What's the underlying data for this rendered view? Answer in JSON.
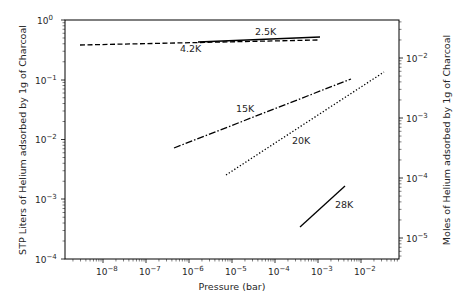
{
  "chart_data": {
    "type": "line",
    "title": "",
    "xlabel": "Pressure (bar)",
    "ylabel": "STP Liters of Helium adsorbed by 1g of Charcoal",
    "ylabel_right": "Moles of Helium adsorbed by 1g of Charcoal",
    "xscale": "log",
    "yscale": "log",
    "xlim": [
      1.3e-09,
      0.075
    ],
    "ylim": [
      0.0001,
      1
    ],
    "ylim_right": [
      4.46e-06,
      0.0446
    ],
    "xticks": [
      "10⁻⁸",
      "10⁻⁷",
      "10⁻⁶",
      "10⁻⁵",
      "10⁻⁴",
      "10⁻³",
      "10⁻²"
    ],
    "xtick_values": [
      1e-08,
      1e-07,
      1e-06,
      1e-05,
      0.0001,
      0.001,
      0.01
    ],
    "yticks": [
      "10⁰",
      "10⁻¹",
      "10⁻²",
      "10⁻³",
      "10⁻⁴"
    ],
    "ytick_values": [
      1,
      0.1,
      0.01,
      0.001,
      0.0001
    ],
    "yticks_right": [
      "10⁻²",
      "10⁻³",
      "10⁻⁴",
      "10⁻⁵"
    ],
    "ytick_right_values": [
      0.01,
      0.001,
      0.0001,
      1e-05
    ],
    "grid": false,
    "legend": "none (inline labels)",
    "series": [
      {
        "name": "2.5K",
        "style": "solid",
        "x": [
          1.6e-06,
          0.0011
        ],
        "y": [
          0.43,
          0.52
        ],
        "label_pos": [
          5e-05,
          0.62
        ]
      },
      {
        "name": "4.2K",
        "style": "dashed",
        "x": [
          3e-09,
          0.001
        ],
        "y": [
          0.38,
          0.47
        ],
        "label_pos": [
          2e-06,
          0.31
        ]
      },
      {
        "name": "15K",
        "style": "dashdot",
        "x": [
          4.9e-07,
          0.0063
        ],
        "y": [
          0.0072,
          0.102
        ],
        "label_pos": [
          2e-06,
          0.022
        ]
      },
      {
        "name": "20K",
        "style": "dotted",
        "x": [
          7.9e-06,
          0.036
        ],
        "y": [
          0.0025,
          0.135
        ],
        "label_pos": [
          8e-05,
          0.0078
        ]
      },
      {
        "name": "28K",
        "style": "solid",
        "x": [
          0.0004,
          0.012
        ],
        "y": [
          0.00034,
          0.0046
        ],
        "label_pos": [
          0.006,
          0.00045
        ]
      }
    ]
  },
  "labels": {
    "xlabel": "Pressure (bar)",
    "ylabel": "STP Liters of Helium adsorbed by 1g of Charcoal",
    "ylabel_right": "Moles of Helium adsorbed by 1g of Charcoal",
    "series": [
      "2.5K",
      "4.2K",
      "15K",
      "20K",
      "28K"
    ],
    "xticks": [
      "−8",
      "−7",
      "−6",
      "−5",
      "−4",
      "−3",
      "−2"
    ],
    "yticks": [
      "0",
      "−1",
      "−2",
      "−3",
      "−4"
    ],
    "yticks_right": [
      "−2",
      "−3",
      "−4",
      "−5"
    ],
    "base": "10"
  }
}
